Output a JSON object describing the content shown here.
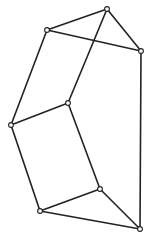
{
  "diagram": {
    "type": "graph",
    "stroke_color": "#222222",
    "background": "#ffffff",
    "nodes": [
      {
        "id": "A",
        "x": 107,
        "y": 9
      },
      {
        "id": "B",
        "x": 47,
        "y": 30
      },
      {
        "id": "C",
        "x": 141,
        "y": 51
      },
      {
        "id": "D",
        "x": 68,
        "y": 103
      },
      {
        "id": "E",
        "x": 11,
        "y": 125
      },
      {
        "id": "F",
        "x": 100,
        "y": 189
      },
      {
        "id": "G",
        "x": 40,
        "y": 211
      },
      {
        "id": "H",
        "x": 140,
        "y": 229
      }
    ],
    "edges": [
      [
        "A",
        "B"
      ],
      [
        "A",
        "C"
      ],
      [
        "B",
        "C"
      ],
      [
        "A",
        "D"
      ],
      [
        "B",
        "E"
      ],
      [
        "D",
        "E"
      ],
      [
        "C",
        "H"
      ],
      [
        "D",
        "F"
      ],
      [
        "E",
        "G"
      ],
      [
        "F",
        "G"
      ],
      [
        "F",
        "H"
      ],
      [
        "G",
        "H"
      ]
    ]
  }
}
